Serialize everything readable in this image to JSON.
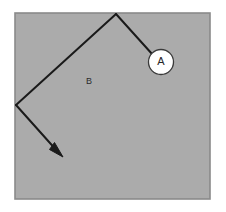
{
  "figure": {
    "type": "geometric-vector-diagram",
    "background_color": "#ffffff",
    "panel": {
      "name": "gray-square-panel",
      "fill_color": "#ababab",
      "border_color": "#8a8a8a",
      "x": 14,
      "y": 12,
      "width": 197,
      "height": 188
    },
    "stroke_color": "#1a1a1a",
    "stroke_width": 2,
    "labels": {
      "node_a": "A",
      "region_b": "B"
    },
    "node_circle": {
      "name": "circle-node-a",
      "center_x": 161,
      "center_y": 62,
      "radius": 13,
      "fill_color": "#ffffff",
      "border_color": "#3a3a3a"
    },
    "region_label": {
      "name": "region-label-b",
      "x": 89,
      "y": 82
    },
    "paths": {
      "apex_vertex": {
        "x": 116,
        "y": 14
      },
      "left_vertex": {
        "x": 16,
        "y": 105
      },
      "arrow_tip": {
        "x": 62,
        "y": 156
      },
      "segment_apex_to_circle": "M116,14 L152,54",
      "segment_apex_to_left": "M116,14 L16,105",
      "segment_left_to_arrow": "M16,105 L59,153"
    },
    "arrowhead": {
      "name": "arrowhead",
      "points": "62,156 50,148 54,143"
    }
  }
}
